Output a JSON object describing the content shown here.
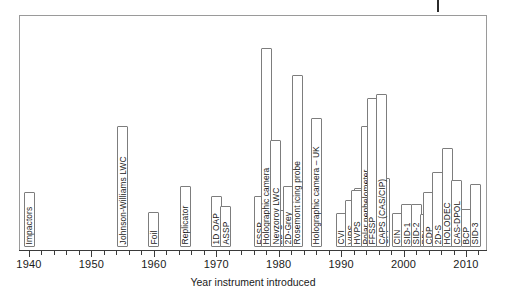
{
  "chart_data": {
    "type": "bar",
    "title": "",
    "subtitle": "",
    "xlabel": "Year instrument introduced",
    "ylabel": "",
    "xlim": [
      1939,
      2014
    ],
    "ylim": [
      0,
      1
    ],
    "grid": false,
    "legend": null,
    "orientation": "vertical-bars-with-rotated-labels",
    "axis": {
      "major_ticks": [
        1940,
        1950,
        1960,
        1970,
        1980,
        1990,
        2000,
        2010
      ],
      "major_tick_labels": [
        "1940",
        "1950",
        "1960",
        "1970",
        "1980",
        "1990",
        "2000",
        "2010"
      ],
      "minor_tick_interval": 2,
      "minor_ticks": [
        1942,
        1944,
        1946,
        1948,
        1952,
        1954,
        1956,
        1958,
        1962,
        1964,
        1966,
        1968,
        1972,
        1974,
        1976,
        1978,
        1982,
        1984,
        1986,
        1988,
        1992,
        1994,
        1996,
        1998,
        2002,
        2004,
        2006,
        2008,
        2012
      ]
    },
    "categories": [
      "Impactors",
      "Johnson-Williams LWC",
      "Foil",
      "Replicator",
      "1D OAP",
      "ASSP",
      "FSSP",
      "King Probe",
      "2D-C",
      "2D-Grey",
      "Rosemont icing probe",
      "Holographic camera",
      "Nevzorov LWC",
      "Holographic camera – UK",
      "CVI",
      "VIPS",
      "PVM",
      "HYVIS",
      "HVPS",
      "Polar nephelometer",
      "Cloud scope",
      "CPI",
      "FFSSP",
      "CAPS (CAS/CIP)",
      "CIN",
      "SID-1",
      "SID-2",
      "PDI",
      "CDP",
      "2D-S",
      "HOLODEC",
      "CAS-DPOL",
      "BCP",
      "SID-3"
    ],
    "values": [
      1940,
      1955,
      1960,
      1965,
      1970,
      1971.5,
      1977,
      1978.5,
      1980,
      1981.5,
      1983,
      1978,
      1979.5,
      1986,
      1990,
      1991.5,
      1993,
      1994.5,
      1992.5,
      1994,
      1995.5,
      1997,
      1995,
      1996.5,
      1999,
      2000.5,
      2002,
      2003.5,
      2004,
      2005.5,
      2007,
      2008.5,
      2010,
      2011.5
    ],
    "annotations": "Each labelled box marks the year a cloud-microphysics instrument was first introduced; box height is decorative only."
  },
  "instruments": [
    {
      "label": "Impactors",
      "year": 1940,
      "top": 192
    },
    {
      "label": "Johnson-Williams LWC",
      "year": 1955,
      "top": 126
    },
    {
      "label": "Foil",
      "year": 1960,
      "top": 212
    },
    {
      "label": "Replicator",
      "year": 1965,
      "top": 186
    },
    {
      "label": "1D OAP",
      "year": 1970,
      "top": 196
    },
    {
      "label": "ASSP",
      "year": 1971.5,
      "top": 206
    },
    {
      "label": "FSSP",
      "year": 1977,
      "top": 196
    },
    {
      "label": "King Probe",
      "year": 1978.5,
      "top": 184
    },
    {
      "label": "2D-C",
      "year": 1980,
      "top": 210
    },
    {
      "label": "2D-Grey",
      "year": 1981.5,
      "top": 186
    },
    {
      "label": "Rosemont icing probe",
      "year": 1983,
      "top": 75
    },
    {
      "label": "Holographic camera",
      "year": 1978,
      "top": 48
    },
    {
      "label": "Nevzorov LWC",
      "year": 1979.5,
      "top": 140
    },
    {
      "label": "Holographic camera – UK",
      "year": 1986,
      "top": 118
    },
    {
      "label": "CVI",
      "year": 1990,
      "top": 213
    },
    {
      "label": "VIPS",
      "year": 1991.5,
      "top": 200
    },
    {
      "label": "PVM",
      "year": 1993,
      "top": 188
    },
    {
      "label": "HYVIS",
      "year": 1994.5,
      "top": 176
    },
    {
      "label": "HVPS",
      "year": 1992.5,
      "top": 190
    },
    {
      "label": "Polar nephelometer",
      "year": 1994,
      "top": 126
    },
    {
      "label": "Cloud scope",
      "year": 1995.5,
      "top": 162
    },
    {
      "label": "CPI",
      "year": 1997,
      "top": 178
    },
    {
      "label": "FFSSP",
      "year": 1995,
      "top": 98
    },
    {
      "label": "CAPS (CAS/CIP)",
      "year": 1996.5,
      "top": 94
    },
    {
      "label": "CIN",
      "year": 1999,
      "top": 213
    },
    {
      "label": "SID-1",
      "year": 2000.5,
      "top": 204
    },
    {
      "label": "SID-2",
      "year": 2002,
      "top": 204
    },
    {
      "label": "PDI",
      "year": 2003.5,
      "top": 214
    },
    {
      "label": "CDP",
      "year": 2004,
      "top": 192
    },
    {
      "label": "2D-S",
      "year": 2005.5,
      "top": 172
    },
    {
      "label": "HOLODEC",
      "year": 2007,
      "top": 148
    },
    {
      "label": "CAS-DPOL",
      "year": 2008.5,
      "top": 180
    },
    {
      "label": "BCP",
      "year": 2010,
      "top": 209
    },
    {
      "label": "SID-3",
      "year": 2011.5,
      "top": 184
    }
  ]
}
